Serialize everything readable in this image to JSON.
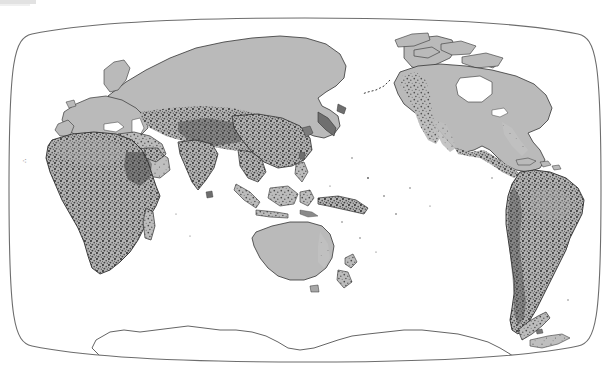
{
  "figure": {
    "kind": "world-map",
    "title": "",
    "projection": "pacific-centered pseudocylindrical (Robinson-like) world map",
    "orientation": "Pacific-centered, 150°E central meridian",
    "edge_label": "∴",
    "colors": {
      "ocean": "#ffffff",
      "land_base": "#bcbcbc",
      "land_shade_dark": "#4a4a4a",
      "coastline": "#2f2f2f",
      "frame": "#6d6d6d",
      "antarctica_fill": "#ffffff",
      "artifact_strip": "#e2e2e2"
    },
    "frame": {
      "left_x": 10,
      "right_x": 601,
      "top_y": 20,
      "bottom_y": 365,
      "shape": "rounded oval / elliptical graticule border"
    },
    "legend": {
      "visible": false,
      "entries": []
    },
    "axis_labels": {
      "visible": false
    },
    "graticule": {
      "visible": false,
      "note": "no interior lat/long lines drawn; only the outer frame"
    },
    "landmasses": [
      {
        "name": "Eurasia",
        "label": "",
        "fill": "land_base",
        "texture": "heavy dark stipple across Central/South/East Asia; plain gray across Siberia and Europe"
      },
      {
        "name": "Africa",
        "label": "",
        "fill": "land_base",
        "texture": "heavy dark stipple throughout"
      },
      {
        "name": "North America",
        "label": "",
        "fill": "land_base",
        "texture": "mostly plain gray with stipple along western cordillera and Mexico"
      },
      {
        "name": "South America",
        "label": "",
        "fill": "land_base",
        "texture": "very heavy dark stipple throughout"
      },
      {
        "name": "Australia",
        "label": "",
        "fill": "land_base",
        "texture": "plain light gray, minimal stipple"
      },
      {
        "name": "Antarctica",
        "label": "",
        "fill": "antarctica_fill",
        "texture": "outline only, unfilled white"
      },
      {
        "name": "Greenland",
        "label": "",
        "fill": "land_base",
        "texture": "plain gray"
      },
      {
        "name": "Maritime Southeast Asia",
        "label": "",
        "fill": "land_base",
        "texture": "dense fine stipple on island arcs"
      },
      {
        "name": "New Zealand",
        "label": "",
        "fill": "land_base",
        "texture": "stippled"
      },
      {
        "name": "Madagascar",
        "label": "",
        "fill": "land_base",
        "texture": "stippled"
      }
    ]
  }
}
